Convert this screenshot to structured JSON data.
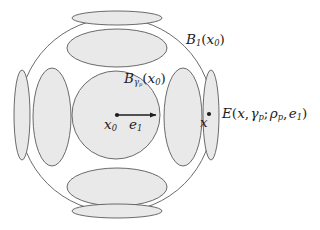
{
  "figure": {
    "colors": {
      "background": "#ffffff",
      "stroke": "#5a5a5a",
      "fill": "#e9e9e9",
      "text": "#1d1d1d",
      "arrow": "#1d1d1d"
    }
  },
  "labels": {
    "outer_ball": {
      "base": "B",
      "sub": "1",
      "arg_open": "(",
      "arg_base": "x",
      "arg_sub": "0",
      "arg_close": ")"
    },
    "inner_ball": {
      "base": "B",
      "sub": "γ",
      "sub_sub": "p",
      "arg_open": "(",
      "arg_base": "x",
      "arg_sub": "0",
      "arg_close": ")"
    },
    "ellipsoid": {
      "base": "E",
      "open": "(",
      "arg1": "x",
      "comma1": ",",
      "arg2": "γ",
      "arg2_sub": "p",
      "semicolon": ";",
      "arg3": "ρ",
      "arg3_sub": "p",
      "comma2": ",",
      "arg4": "e",
      "arg4_sub": "1",
      "close": ")"
    },
    "center_point": {
      "base": "x",
      "sub": "0"
    },
    "direction_vector": {
      "base": "e",
      "sub": "1"
    },
    "boundary_point": {
      "base": "x"
    }
  },
  "geometry": {
    "outer_ball": {
      "cx": 116,
      "cy": 115,
      "r": 97
    },
    "inner_ball": {
      "cx": 116,
      "cy": 115,
      "r": 44
    },
    "arrow": {
      "x1": 117,
      "y1": 115,
      "x2": 158,
      "y2": 115
    },
    "center_dot": {
      "cx": 117,
      "cy": 115,
      "r": 2.1
    },
    "boundary_dot": {
      "cx": 209,
      "cy": 114,
      "r": 2.1
    },
    "ellipsoids": [
      {
        "name": "left-boundary",
        "cx": 22,
        "cy": 115,
        "rx": 8,
        "ry": 45,
        "rotate": 0
      },
      {
        "name": "left-inner",
        "cx": 52,
        "cy": 117,
        "rx": 19,
        "ry": 49,
        "rotate": 0
      },
      {
        "name": "right-inner",
        "cx": 183,
        "cy": 117,
        "rx": 19,
        "ry": 49,
        "rotate": 0
      },
      {
        "name": "right-boundary",
        "cx": 211,
        "cy": 115,
        "rx": 8,
        "ry": 45,
        "rotate": 0
      },
      {
        "name": "top-boundary",
        "cx": 117,
        "cy": 18,
        "rx": 45,
        "ry": 7,
        "rotate": 0
      },
      {
        "name": "top-inner",
        "cx": 117,
        "cy": 48,
        "rx": 50,
        "ry": 19,
        "rotate": 0
      },
      {
        "name": "bottom-inner",
        "cx": 117,
        "cy": 187,
        "rx": 50,
        "ry": 19,
        "rotate": 0
      },
      {
        "name": "bottom-boundary",
        "cx": 117,
        "cy": 211,
        "rx": 45,
        "ry": 7,
        "rotate": 0
      }
    ]
  }
}
